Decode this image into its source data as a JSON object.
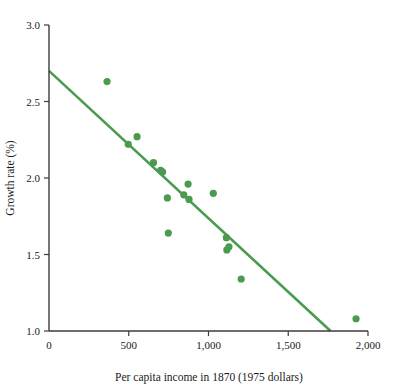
{
  "chart_data": {
    "type": "scatter",
    "title": "",
    "xlabel": "Per capita income in 1870 (1975 dollars)",
    "ylabel": "Growth rate (%)",
    "xlim": [
      0,
      2000
    ],
    "ylim": [
      1.0,
      3.0
    ],
    "xticks": [
      0,
      500,
      1000,
      1500,
      2000
    ],
    "xtick_labels": [
      "0",
      "500",
      "1,000",
      "1,500",
      "2,000"
    ],
    "yticks": [
      1.0,
      1.5,
      2.0,
      2.5,
      3.0
    ],
    "ytick_labels": [
      "1.0",
      "1.5",
      "2.0",
      "2.5",
      "3.0"
    ],
    "grid": false,
    "legend": null,
    "series": [
      {
        "name": "countries",
        "marker": "circle",
        "color": "#4b9b4f",
        "points": [
          {
            "x": 364,
            "y": 2.63
          },
          {
            "x": 497,
            "y": 2.22
          },
          {
            "x": 552,
            "y": 2.27
          },
          {
            "x": 655,
            "y": 2.1
          },
          {
            "x": 700,
            "y": 2.05
          },
          {
            "x": 712,
            "y": 2.04
          },
          {
            "x": 742,
            "y": 1.87
          },
          {
            "x": 748,
            "y": 1.64
          },
          {
            "x": 845,
            "y": 1.89
          },
          {
            "x": 872,
            "y": 1.96
          },
          {
            "x": 878,
            "y": 1.86
          },
          {
            "x": 1030,
            "y": 1.9
          },
          {
            "x": 1112,
            "y": 1.61
          },
          {
            "x": 1115,
            "y": 1.53
          },
          {
            "x": 1128,
            "y": 1.55
          },
          {
            "x": 1205,
            "y": 1.34
          },
          {
            "x": 1925,
            "y": 1.08
          }
        ]
      }
    ],
    "trend_line": {
      "name": "fitted regression line",
      "color": "#4b9b4f",
      "x_start": 0,
      "y_start": 2.7,
      "x_end": 1765,
      "y_end": 1.0
    }
  },
  "axis_labels": {
    "x_title": "Per capita income in 1870 (1975 dollars)",
    "y_title": "Growth rate (%)"
  }
}
